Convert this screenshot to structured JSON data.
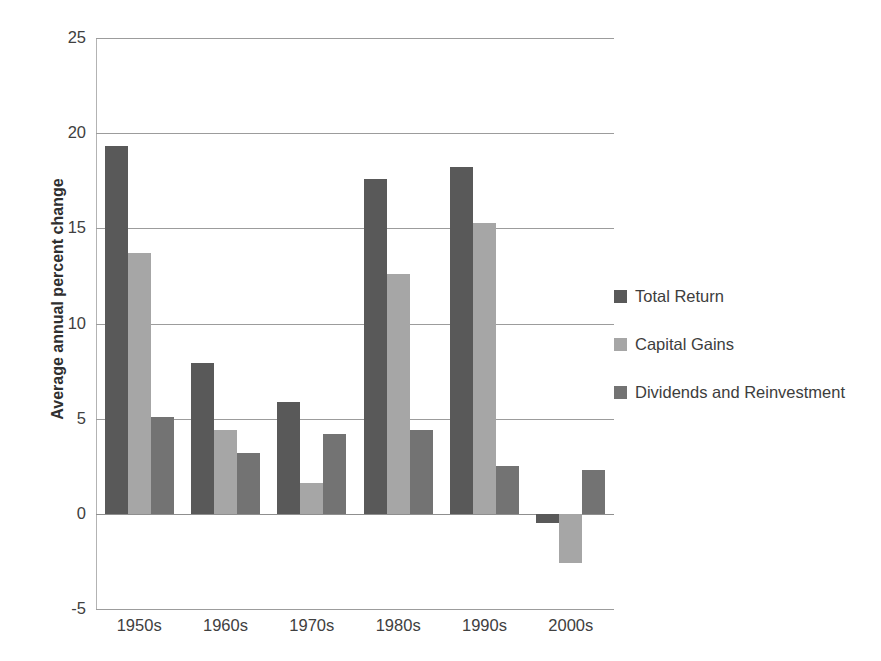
{
  "chart_data": {
    "type": "bar",
    "title": "",
    "subtitle": "",
    "xlabel": "",
    "ylabel": "Average annual percent change",
    "ylim": [
      -5,
      25
    ],
    "yticks": [
      25,
      20,
      15,
      10,
      5,
      0,
      -5
    ],
    "ytick_labels": [
      "25",
      "20",
      "15",
      "10",
      "5",
      "0",
      "-5"
    ],
    "grid": true,
    "legend_position": "right",
    "categories": [
      "1950s",
      "1960s",
      "1970s",
      "1980s",
      "1990s",
      "2000s"
    ],
    "series": [
      {
        "name": "Total Return",
        "color": "#595959",
        "values": [
          19.3,
          7.9,
          5.9,
          17.6,
          18.2,
          -0.5
        ]
      },
      {
        "name": "Capital Gains",
        "color": "#a6a6a6",
        "values": [
          13.7,
          4.4,
          1.6,
          12.6,
          15.3,
          -2.6
        ]
      },
      {
        "name": "Dividends and Reinvestment",
        "color": "#737373",
        "values": [
          5.1,
          3.2,
          4.2,
          4.4,
          2.5,
          2.3
        ]
      }
    ]
  },
  "colors": {
    "gridline": "#9c9c9c",
    "axis": "#b3b3b3",
    "text": "#404040",
    "background": "#ffffff"
  }
}
